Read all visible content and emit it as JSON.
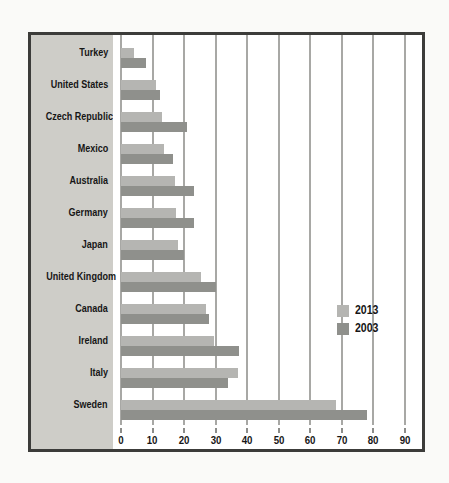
{
  "chart_data": {
    "type": "bar",
    "orientation": "horizontal",
    "title": "",
    "xlabel": "",
    "ylabel": "",
    "xlim": [
      0,
      90
    ],
    "x_ticks": [
      0,
      10,
      20,
      30,
      40,
      50,
      60,
      70,
      80,
      90
    ],
    "grid": "vertical",
    "legend_position": "inside-right",
    "categories": [
      "Turkey",
      "United States",
      "Czech Republic",
      "Mexico",
      "Australia",
      "Germany",
      "Japan",
      "United Kingdom",
      "Canada",
      "Ireland",
      "Italy",
      "Sweden"
    ],
    "series": [
      {
        "name": "2013",
        "color": "#b5b5b2",
        "values": [
          4,
          11,
          13,
          13.5,
          17,
          17.5,
          18,
          25.5,
          27,
          29.5,
          37,
          68
        ]
      },
      {
        "name": "2003",
        "color": "#8f908c",
        "values": [
          8,
          12.5,
          21,
          16.5,
          23,
          23,
          20,
          30,
          28,
          37.5,
          34,
          78
        ]
      }
    ]
  },
  "legend": {
    "items": [
      {
        "label": "2013"
      },
      {
        "label": "2003"
      }
    ]
  },
  "style_colors": {
    "frame_border": "#3c3c3a",
    "label_panel_bg": "#cecdc8",
    "gridline": "#a8a8a5",
    "plot_bg": "#ffffff",
    "page_bg": "#fafaf8",
    "text": "#161616"
  }
}
